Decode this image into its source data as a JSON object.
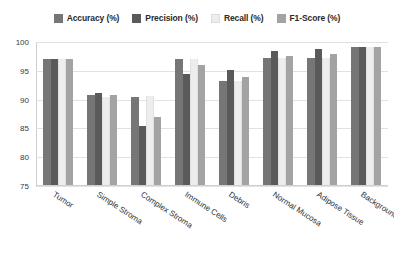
{
  "chart_data": {
    "type": "bar",
    "title": "",
    "subtitle": "",
    "xlabel": "",
    "ylabel": "",
    "ylim": [
      75,
      100
    ],
    "yticks": [
      75,
      80,
      85,
      90,
      95,
      100
    ],
    "grid": true,
    "legend_position": "top-center",
    "categories": [
      "Tumor",
      "Simple Stroma",
      "Complex Stroma",
      "Immune Cells",
      "Debris",
      "Normal Mucosa",
      "Adipose Tissue",
      "Background"
    ],
    "series": [
      {
        "name": "Accuracy (%)",
        "color": "#767676",
        "values": [
          97.0,
          90.8,
          90.5,
          97.0,
          93.2,
          97.2,
          97.3,
          99.2
        ]
      },
      {
        "name": "Precision (%)",
        "color": "#5a5a5a",
        "values": [
          97.0,
          91.2,
          85.5,
          94.5,
          95.2,
          98.5,
          98.8,
          99.2
        ]
      },
      {
        "name": "Recall (%)",
        "color": "#ededed",
        "values": [
          97.0,
          90.5,
          90.6,
          97.0,
          93.2,
          97.2,
          97.3,
          99.2
        ]
      },
      {
        "name": "F1-Score (%)",
        "color": "#a3a3a3",
        "values": [
          97.0,
          90.8,
          87.0,
          96.0,
          94.0,
          97.6,
          98.0,
          99.2
        ]
      }
    ]
  },
  "colors": {
    "background": "#ffffff",
    "gridline": "#e2e2e2",
    "axis": "#cfcfcf",
    "text": "#2f2f2f",
    "legend_text": "#2b2b2b"
  }
}
